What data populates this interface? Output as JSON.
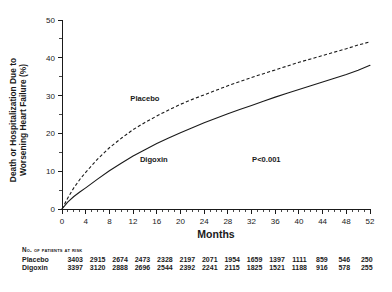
{
  "chart_data": {
    "type": "line",
    "title": "",
    "xlabel": "Months",
    "ylabel": "Death or Hospitalization Due to Worsening Heart Failure (%)",
    "ylabel_line1": "Death or Hospitalization Due to",
    "ylabel_line2": "Worsening Heart Failure (%)",
    "xlim": [
      0,
      52
    ],
    "ylim": [
      0,
      50
    ],
    "xticks": [
      0,
      4,
      8,
      12,
      16,
      20,
      24,
      28,
      32,
      36,
      40,
      44,
      48,
      52
    ],
    "xtick_labels": [
      "0",
      "4",
      "8",
      "12",
      "16",
      "20",
      "24",
      "28",
      "32",
      "36",
      "40",
      "44",
      "48",
      "52"
    ],
    "x_minor_interval": 1,
    "yticks": [
      0,
      10,
      20,
      30,
      40,
      50
    ],
    "ytick_labels": [
      "0",
      "10",
      "20",
      "30",
      "40",
      "50"
    ],
    "y_minor_interval": 5,
    "grid": false,
    "legend_position": "in-plot-annotation",
    "annotations": [
      {
        "text": "Placebo",
        "x": 14,
        "y": 28.5
      },
      {
        "text": "Digoxin",
        "x": 15.5,
        "y": 12.5
      },
      {
        "text": "P<0.001",
        "x": 34.5,
        "y": 12.5
      }
    ],
    "series": [
      {
        "name": "Placebo",
        "style": "dashed",
        "color": "#1a1a1a",
        "x": [
          0,
          1,
          2,
          3,
          4,
          6,
          8,
          10,
          12,
          14,
          16,
          18,
          20,
          22,
          24,
          26,
          28,
          30,
          32,
          34,
          36,
          38,
          40,
          42,
          44,
          46,
          48,
          50,
          52
        ],
        "y": [
          0,
          3.0,
          5.6,
          7.8,
          9.7,
          13.2,
          16.2,
          18.7,
          21.0,
          22.9,
          24.6,
          26.2,
          27.7,
          29.0,
          30.2,
          31.4,
          32.6,
          33.7,
          34.8,
          35.8,
          36.8,
          37.8,
          38.8,
          39.7,
          40.6,
          41.5,
          42.4,
          43.4,
          44.2
        ]
      },
      {
        "name": "Digoxin",
        "style": "solid",
        "color": "#1a1a1a",
        "x": [
          0,
          1,
          2,
          3,
          4,
          6,
          8,
          10,
          12,
          14,
          16,
          18,
          20,
          22,
          24,
          26,
          28,
          30,
          32,
          34,
          36,
          38,
          40,
          42,
          44,
          46,
          48,
          50,
          52
        ],
        "y": [
          0,
          1.9,
          3.3,
          4.5,
          5.6,
          7.9,
          10.1,
          12.1,
          14.0,
          15.7,
          17.3,
          18.8,
          20.2,
          21.5,
          22.8,
          24.0,
          25.2,
          26.3,
          27.4,
          28.5,
          29.6,
          30.6,
          31.6,
          32.6,
          33.6,
          34.6,
          35.6,
          36.7,
          38.0
        ]
      }
    ]
  },
  "risk_table": {
    "title": "No. of Patients at Risk",
    "columns": [
      "0",
      "4",
      "8",
      "12",
      "16",
      "20",
      "24",
      "28",
      "32",
      "36",
      "40",
      "44",
      "48",
      "52"
    ],
    "rows": [
      {
        "label": "Placebo",
        "values": [
          "3403",
          "2915",
          "2674",
          "2473",
          "2328",
          "2197",
          "2071",
          "1954",
          "1659",
          "1397",
          "1111",
          "859",
          "546",
          "250"
        ]
      },
      {
        "label": "Digoxin",
        "values": [
          "3397",
          "3120",
          "2888",
          "2696",
          "2544",
          "2392",
          "2241",
          "2115",
          "1825",
          "1521",
          "1188",
          "916",
          "578",
          "255"
        ]
      }
    ]
  }
}
